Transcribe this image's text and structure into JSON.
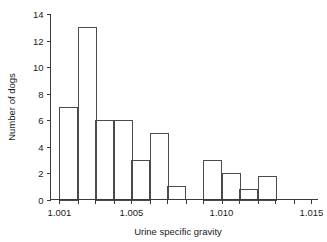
{
  "chart_data": {
    "type": "bar",
    "title": "",
    "xlabel": "Urine specific gravity",
    "ylabel": "Number of dogs",
    "xlim": [
      1.0005,
      1.0155
    ],
    "ylim": [
      0,
      14
    ],
    "grid": false,
    "legend": null,
    "bin_width": 0.001,
    "x_tick_labels": [
      "1.001",
      "1.005",
      "1.010",
      "1.015"
    ],
    "x_tick_values": [
      1.001,
      1.005,
      1.01,
      1.015
    ],
    "x_minor_tick_values": [
      1.001,
      1.002,
      1.003,
      1.004,
      1.005,
      1.006,
      1.007,
      1.008,
      1.009,
      1.01,
      1.011,
      1.012,
      1.013,
      1.014,
      1.015
    ],
    "y_tick_labels": [
      "0",
      "2",
      "4",
      "6",
      "8",
      "10",
      "12",
      "14"
    ],
    "y_tick_values": [
      0,
      2,
      4,
      6,
      8,
      10,
      12,
      14
    ],
    "bin_starts": [
      1.001,
      1.002,
      1.003,
      1.004,
      1.005,
      1.006,
      1.007,
      1.009,
      1.01,
      1.011,
      1.012
    ],
    "bin_ends": [
      1.002,
      1.003,
      1.004,
      1.005,
      1.006,
      1.007,
      1.008,
      1.01,
      1.011,
      1.012,
      1.013
    ],
    "values": [
      7,
      13,
      6,
      6,
      3,
      5,
      1,
      3,
      2,
      0.8,
      1.8
    ],
    "bar_color": "#ffffff",
    "bar_edge_color": "#4a4a4a",
    "axis_color": "#3a3a3a"
  }
}
